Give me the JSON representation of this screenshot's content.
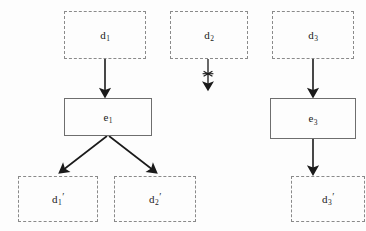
{
  "diagram": {
    "background_color": "#fdfdfd",
    "ink_color": "#1a1a1a",
    "dashed_border_color": "#8a8a8a",
    "solid_border_color": "#6e6e6e",
    "nodes": [
      {
        "id": "d1",
        "label_base": "d",
        "label_sub": "1",
        "label_prime": "",
        "style": "dashed",
        "x": 64,
        "y": 11,
        "w": 82,
        "h": 48
      },
      {
        "id": "d2",
        "label_base": "d",
        "label_sub": "2",
        "label_prime": "",
        "style": "dashed",
        "x": 170,
        "y": 11,
        "w": 78,
        "h": 48
      },
      {
        "id": "d3",
        "label_base": "d",
        "label_sub": "3",
        "label_prime": "",
        "style": "dashed",
        "x": 272,
        "y": 11,
        "w": 82,
        "h": 48
      },
      {
        "id": "e1",
        "label_base": "e",
        "label_sub": "1",
        "label_prime": "",
        "style": "solid",
        "x": 64,
        "y": 98,
        "w": 88,
        "h": 38
      },
      {
        "id": "e3",
        "label_base": "e",
        "label_sub": "3",
        "label_prime": "",
        "style": "solid",
        "x": 270,
        "y": 98,
        "w": 86,
        "h": 41
      },
      {
        "id": "d1p",
        "label_base": "d",
        "label_sub": "1",
        "label_prime": "′",
        "style": "dashed",
        "x": 18,
        "y": 176,
        "w": 80,
        "h": 46
      },
      {
        "id": "d2p",
        "label_base": "d",
        "label_sub": "2",
        "label_prime": "′",
        "style": "dashed",
        "x": 114,
        "y": 176,
        "w": 82,
        "h": 46
      },
      {
        "id": "d3p",
        "label_base": "d",
        "label_sub": "3",
        "label_prime": "′",
        "style": "dashed",
        "x": 291,
        "y": 176,
        "w": 74,
        "h": 46
      }
    ],
    "edges": [
      {
        "id": "edge-d1-to-e1",
        "from": "d1",
        "to": "e1",
        "blocked": false
      },
      {
        "id": "edge-d2-dangling",
        "from": "d2",
        "to": "",
        "blocked": true,
        "marker": "cross"
      },
      {
        "id": "edge-d3-to-e3",
        "from": "d3",
        "to": "e3",
        "blocked": false
      },
      {
        "id": "edge-e1-to-d1p",
        "from": "e1",
        "to": "d1p",
        "blocked": false
      },
      {
        "id": "edge-e1-to-d2p",
        "from": "e1",
        "to": "d2p",
        "blocked": false
      },
      {
        "id": "edge-e3-to-d3p",
        "from": "e3",
        "to": "d3p",
        "blocked": false
      }
    ]
  }
}
